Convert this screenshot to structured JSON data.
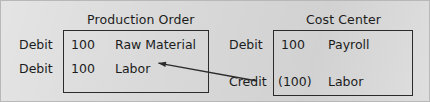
{
  "diagram": {
    "background_color": "#d9d9d9",
    "line_color": "#2b2b2b",
    "text_color": "#1c1c1c",
    "accounts": [
      {
        "title": "Production Order",
        "rows": [
          {
            "side": "Debit",
            "amount": "100",
            "account": "Raw Material"
          },
          {
            "side": "Debit",
            "amount": "100",
            "account": "Labor"
          }
        ]
      },
      {
        "title": "Cost Center",
        "rows": [
          {
            "side": "Debit",
            "amount": "100",
            "account": "Payroll"
          },
          {
            "side": "Credit",
            "amount": "(100)",
            "account": "Labor"
          }
        ]
      }
    ],
    "connector": {
      "name": "labor-credit-to-labor-debit-arrow",
      "from": {
        "x": 256,
        "y": 80
      },
      "to": {
        "x": 157,
        "y": 62
      },
      "arrowhead": "at-to-end"
    }
  }
}
